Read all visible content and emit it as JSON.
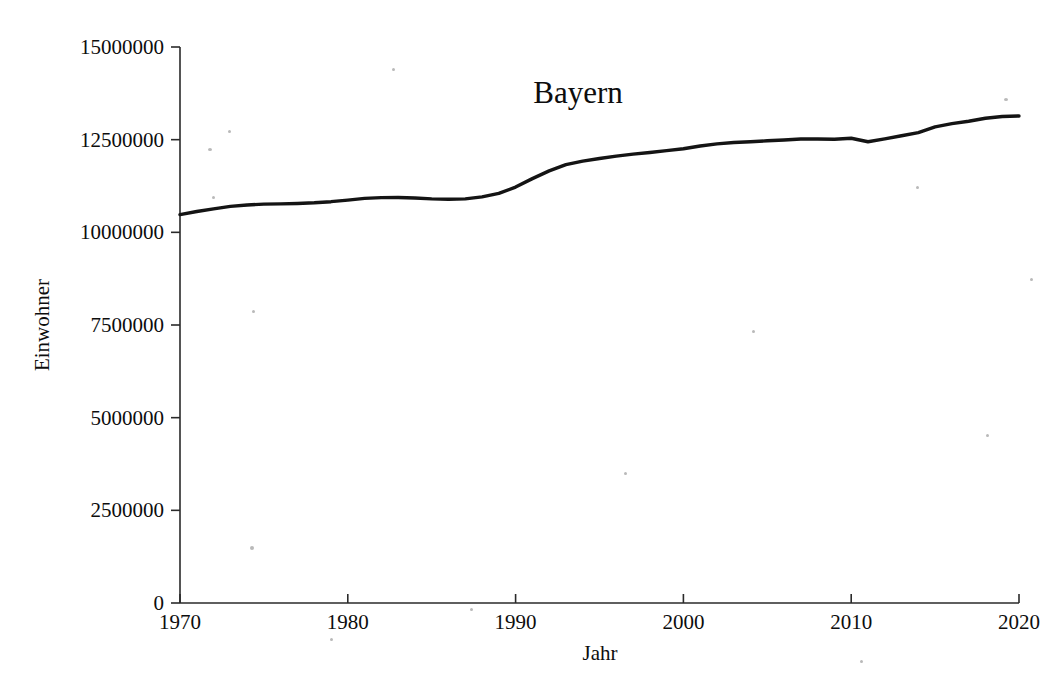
{
  "figure": {
    "background_color": "#ffffff",
    "ink_color": "#141414"
  },
  "chart_data": {
    "type": "line",
    "title": "Bayern",
    "xlabel": "Jahr",
    "ylabel": "Einwohner",
    "xlim": [
      1970,
      2020
    ],
    "ylim": [
      0,
      15000000
    ],
    "xticks": [
      1970,
      1980,
      1990,
      2000,
      2010,
      2020
    ],
    "xticklabels": [
      "1970",
      "1980",
      "1990",
      "2000",
      "2010",
      "2020"
    ],
    "yticks": [
      0,
      2500000,
      5000000,
      7500000,
      10000000,
      12500000,
      15000000
    ],
    "yticklabels": [
      "0",
      "2500000",
      "5000000",
      "7500000",
      "10000000",
      "12500000",
      "15000000"
    ],
    "grid": false,
    "legend": false,
    "series": [
      {
        "name": "Einwohner Bayern",
        "color": "#141414",
        "x": [
          1970,
          1971,
          1972,
          1973,
          1974,
          1975,
          1976,
          1977,
          1978,
          1979,
          1980,
          1981,
          1982,
          1983,
          1984,
          1985,
          1986,
          1987,
          1988,
          1989,
          1990,
          1991,
          1992,
          1993,
          1994,
          1995,
          1996,
          1997,
          1998,
          1999,
          2000,
          2001,
          2002,
          2003,
          2004,
          2005,
          2006,
          2007,
          2008,
          2009,
          2010,
          2011,
          2012,
          2013,
          2014,
          2015,
          2016,
          2017,
          2018,
          2019,
          2020
        ],
        "y": [
          10479000,
          10561000,
          10634000,
          10700000,
          10739000,
          10760000,
          10767000,
          10779000,
          10797000,
          10827000,
          10869000,
          10916000,
          10937000,
          10940000,
          10926000,
          10903000,
          10894000,
          10902000,
          10958000,
          11049000,
          11221000,
          11449000,
          11657000,
          11826000,
          11922000,
          11993000,
          12057000,
          12111000,
          12155000,
          12205000,
          12255000,
          12330000,
          12387000,
          12423000,
          12444000,
          12469000,
          12492000,
          12520000,
          12520000,
          12510000,
          12538000,
          12443000,
          12520000,
          12605000,
          12691000,
          12844000,
          12931000,
          12997000,
          13077000,
          13125000,
          13140000
        ]
      }
    ],
    "annotations": []
  }
}
